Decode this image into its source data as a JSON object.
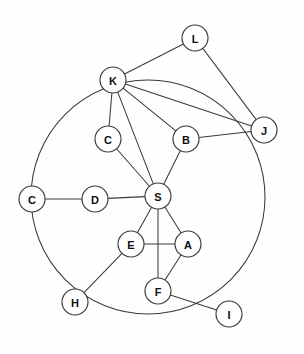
{
  "diagram": {
    "type": "node-link-graph",
    "background_color": "#fefefe",
    "stroke_color": "#3b3b3b",
    "node_fill_color": "#ffffff",
    "label_color": "#111111",
    "node_radius": 13,
    "width": 304,
    "height": 354
  },
  "ring": {
    "name": "outer-circle",
    "cx": 148,
    "cy": 197,
    "r": 117,
    "passes_through": [
      "K",
      "C2",
      "H",
      "I",
      "J"
    ]
  },
  "nodes": [
    {
      "id": "L",
      "label": "L",
      "x": 195,
      "y": 38
    },
    {
      "id": "K",
      "label": "K",
      "x": 113,
      "y": 80
    },
    {
      "id": "J",
      "label": "J",
      "x": 264,
      "y": 130
    },
    {
      "id": "C1",
      "label": "C",
      "x": 108,
      "y": 139
    },
    {
      "id": "B",
      "label": "B",
      "x": 186,
      "y": 139
    },
    {
      "id": "C2",
      "label": "C",
      "x": 32,
      "y": 199
    },
    {
      "id": "D",
      "label": "D",
      "x": 95,
      "y": 199
    },
    {
      "id": "S",
      "label": "S",
      "x": 158,
      "y": 196
    },
    {
      "id": "E",
      "label": "E",
      "x": 131,
      "y": 244
    },
    {
      "id": "A",
      "label": "A",
      "x": 188,
      "y": 244
    },
    {
      "id": "F",
      "label": "F",
      "x": 158,
      "y": 291
    },
    {
      "id": "H",
      "label": "H",
      "x": 75,
      "y": 302
    },
    {
      "id": "I",
      "label": "I",
      "x": 229,
      "y": 314
    }
  ],
  "edges": [
    {
      "from": "L",
      "to": "K"
    },
    {
      "from": "L",
      "to": "J"
    },
    {
      "from": "K",
      "to": "J"
    },
    {
      "from": "K",
      "to": "B"
    },
    {
      "from": "K",
      "to": "C1"
    },
    {
      "from": "K",
      "to": "S"
    },
    {
      "from": "B",
      "to": "J"
    },
    {
      "from": "B",
      "to": "S"
    },
    {
      "from": "C1",
      "to": "S"
    },
    {
      "from": "C2",
      "to": "D"
    },
    {
      "from": "D",
      "to": "S"
    },
    {
      "from": "S",
      "to": "E"
    },
    {
      "from": "S",
      "to": "F"
    },
    {
      "from": "S",
      "to": "A"
    },
    {
      "from": "E",
      "to": "A"
    },
    {
      "from": "E",
      "to": "H"
    },
    {
      "from": "A",
      "to": "F"
    },
    {
      "from": "F",
      "to": "I"
    }
  ]
}
